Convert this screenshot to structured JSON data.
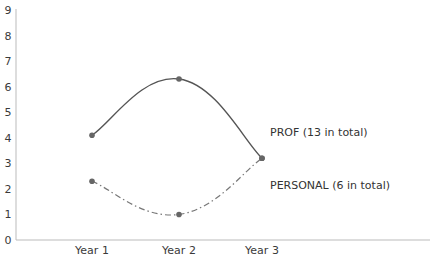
{
  "chart_data": {
    "type": "line",
    "title": "",
    "xlabel": "",
    "ylabel": "",
    "categories": [
      "Year 1",
      "Year 2",
      "Year 3"
    ],
    "ylim": [
      0,
      9
    ],
    "yticks": [
      "0",
      "1",
      "2",
      "3",
      "4",
      "5",
      "6",
      "7",
      "8",
      "9"
    ],
    "grid": false,
    "legend_position": "inline-right",
    "series": [
      {
        "name": "PROF (13 in total)",
        "values": [
          4.1,
          6.3,
          3.2
        ],
        "style": "solid",
        "smooth": true,
        "color": "#555555"
      },
      {
        "name": "PERSONAL (6 in total)",
        "values": [
          2.3,
          1.0,
          3.2
        ],
        "style": "dash-dot",
        "smooth": true,
        "color": "#777777"
      }
    ]
  },
  "colors": {
    "axis": "#bbbbbb",
    "marker": "#666666",
    "text": "#333333"
  }
}
